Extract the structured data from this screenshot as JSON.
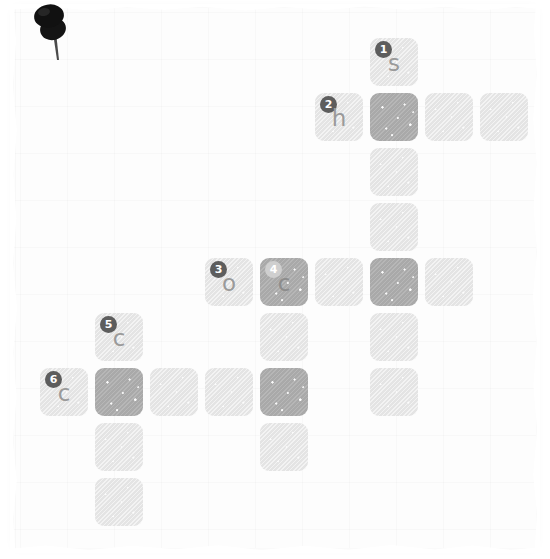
{
  "app": {
    "title": "Crossword Puzzle",
    "surface": "notepad-paper"
  },
  "colors": {
    "paper": "#fdfdfd",
    "cell_empty": "#e4e4e4",
    "cell_filled": "#a9a9a9",
    "letter": "#9a9a9a",
    "number_badge": "#5d5d5d",
    "number_badge_on_dark": "#cfcfcf",
    "pin": "#1a1a1a"
  },
  "pin": {
    "icon": "pushpin-icon"
  },
  "grid": {
    "columns": 8,
    "rows": 10,
    "cell_size": 48,
    "pitch": 55,
    "origin_x": 40,
    "origin_y": 38,
    "cells": [
      {
        "row": 0,
        "col": 6,
        "state": "light",
        "number": "1",
        "letter": "s"
      },
      {
        "row": 1,
        "col": 5,
        "state": "light",
        "number": "2",
        "letter": "h"
      },
      {
        "row": 1,
        "col": 6,
        "state": "dark",
        "number": "",
        "letter": ""
      },
      {
        "row": 1,
        "col": 7,
        "state": "light",
        "number": "",
        "letter": ""
      },
      {
        "row": 1,
        "col": 8,
        "state": "light",
        "number": "",
        "letter": ""
      },
      {
        "row": 2,
        "col": 6,
        "state": "light",
        "number": "",
        "letter": ""
      },
      {
        "row": 3,
        "col": 6,
        "state": "light",
        "number": "",
        "letter": ""
      },
      {
        "row": 4,
        "col": 3,
        "state": "light",
        "number": "3",
        "letter": "o"
      },
      {
        "row": 4,
        "col": 4,
        "state": "dark",
        "number": "4",
        "letter": "c"
      },
      {
        "row": 4,
        "col": 5,
        "state": "light",
        "number": "",
        "letter": ""
      },
      {
        "row": 4,
        "col": 6,
        "state": "dark",
        "number": "",
        "letter": ""
      },
      {
        "row": 4,
        "col": 7,
        "state": "light",
        "number": "",
        "letter": ""
      },
      {
        "row": 5,
        "col": 1,
        "state": "light",
        "number": "5",
        "letter": "c"
      },
      {
        "row": 5,
        "col": 4,
        "state": "light",
        "number": "",
        "letter": ""
      },
      {
        "row": 5,
        "col": 6,
        "state": "light",
        "number": "",
        "letter": ""
      },
      {
        "row": 6,
        "col": 0,
        "state": "light",
        "number": "6",
        "letter": "c"
      },
      {
        "row": 6,
        "col": 1,
        "state": "dark",
        "number": "",
        "letter": ""
      },
      {
        "row": 6,
        "col": 2,
        "state": "light",
        "number": "",
        "letter": ""
      },
      {
        "row": 6,
        "col": 3,
        "state": "light",
        "number": "",
        "letter": ""
      },
      {
        "row": 6,
        "col": 4,
        "state": "dark",
        "number": "",
        "letter": ""
      },
      {
        "row": 6,
        "col": 6,
        "state": "light",
        "number": "",
        "letter": ""
      },
      {
        "row": 7,
        "col": 1,
        "state": "light",
        "number": "",
        "letter": ""
      },
      {
        "row": 7,
        "col": 4,
        "state": "light",
        "number": "",
        "letter": ""
      },
      {
        "row": 8,
        "col": 1,
        "state": "light",
        "number": "",
        "letter": ""
      }
    ]
  },
  "entries": [
    {
      "number": "1",
      "letter": "s"
    },
    {
      "number": "2",
      "letter": "h"
    },
    {
      "number": "3",
      "letter": "o"
    },
    {
      "number": "4",
      "letter": "c"
    },
    {
      "number": "5",
      "letter": "c"
    },
    {
      "number": "6",
      "letter": "c"
    }
  ]
}
